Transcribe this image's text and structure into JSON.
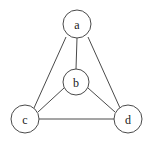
{
  "figure": {
    "background_color": "#ffffff",
    "width": 149,
    "height": 145
  },
  "style": {
    "edge_color": "#4a4a4a",
    "edge_width": 1,
    "node_stroke_color": "#4a4a4a",
    "node_fill_color": "#ffffff",
    "node_stroke_width": 1,
    "label_color": "#1a1a1a",
    "label_font_size": 12
  },
  "graph": {
    "nodes": [
      {
        "id": "a",
        "label": "a",
        "cx": 77,
        "cy": 24,
        "r": 14
      },
      {
        "id": "b",
        "label": "b",
        "cx": 76,
        "cy": 82,
        "r": 13
      },
      {
        "id": "c",
        "label": "c",
        "cx": 25,
        "cy": 119,
        "r": 14
      },
      {
        "id": "d",
        "label": "d",
        "cx": 128,
        "cy": 119,
        "r": 14
      }
    ],
    "edges": [
      {
        "id": "a-b",
        "from": "a",
        "to": "b",
        "x1": 77,
        "y1": 38,
        "x2": 76,
        "y2": 69
      },
      {
        "id": "a-c",
        "from": "a",
        "to": "c",
        "x1": 66,
        "y1": 37,
        "x2": 34,
        "y2": 108
      },
      {
        "id": "a-d",
        "from": "a",
        "to": "d",
        "x1": 88,
        "y1": 37,
        "x2": 120,
        "y2": 108
      },
      {
        "id": "b-c",
        "from": "b",
        "to": "c",
        "x1": 64,
        "y1": 88,
        "x2": 38,
        "y2": 112
      },
      {
        "id": "b-d",
        "from": "b",
        "to": "d",
        "x1": 88,
        "y1": 88,
        "x2": 115,
        "y2": 112
      },
      {
        "id": "c-d",
        "from": "c",
        "to": "d",
        "x1": 39,
        "y1": 119,
        "x2": 114,
        "y2": 119
      }
    ]
  }
}
